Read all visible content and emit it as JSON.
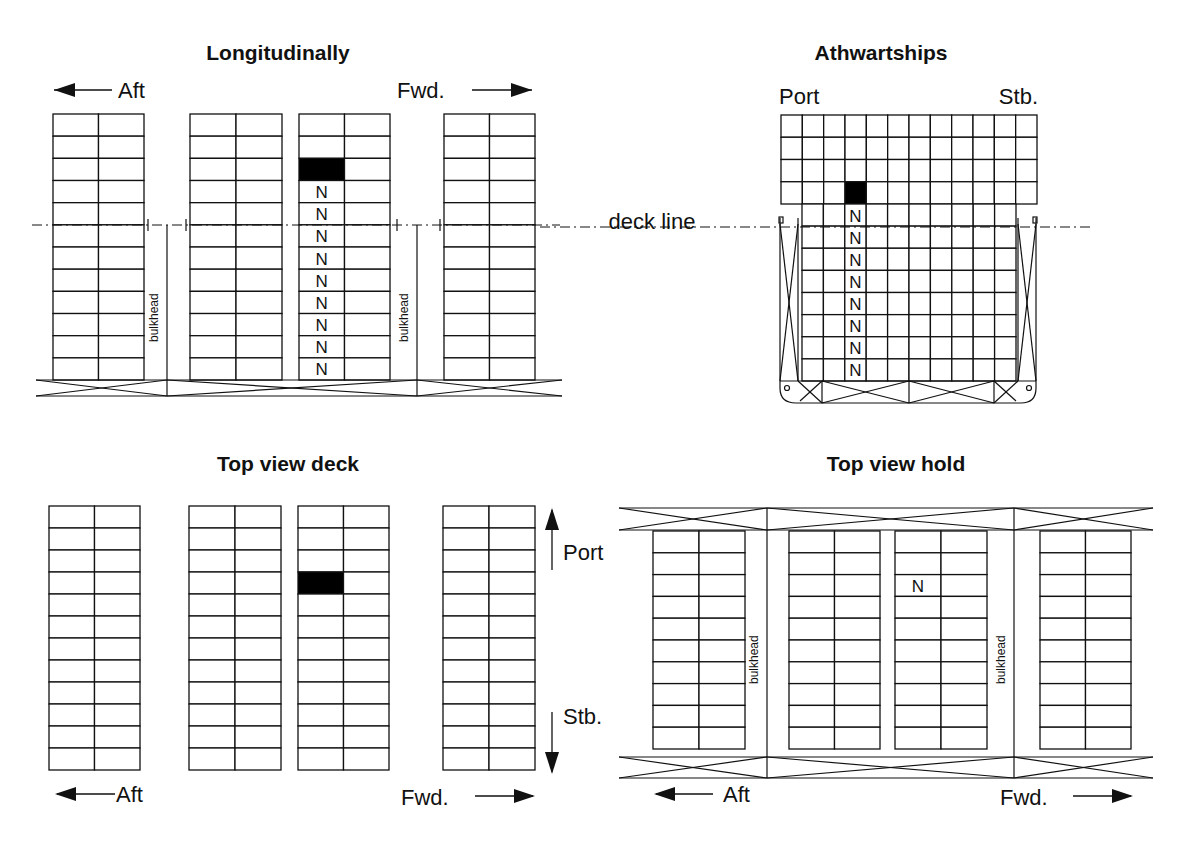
{
  "colors": {
    "ink": "#111111",
    "background": "#ffffff",
    "filled": "#000000"
  },
  "panels": {
    "longitudinal": {
      "title": "Longitudinally",
      "aft_label": "Aft",
      "fwd_label": "Fwd.",
      "bulkhead_label": "bulkhead",
      "rows": 12,
      "stacks": [
        {
          "x": 53,
          "w": 91
        },
        {
          "x": 190,
          "w": 92
        },
        {
          "x": 299,
          "w": 91
        },
        {
          "x": 444,
          "w": 91
        }
      ],
      "filled_cell": {
        "stack": 2,
        "col": 0,
        "row": 2
      },
      "n_marked": {
        "stack": 2,
        "col": 0,
        "rows": [
          3,
          4,
          5,
          6,
          7,
          8,
          9,
          10,
          11
        ]
      },
      "n_glyph": "N"
    },
    "athwartships": {
      "title": "Athwartships",
      "port_label": "Port",
      "stb_label": "Stb.",
      "deck_line_label": "deck line",
      "deck_tiers": 4,
      "deck_columns": 12,
      "hold_tiers": 8,
      "hold_columns": 10,
      "filled_cell": {
        "col": 3,
        "tier": 3
      },
      "n_column": 3,
      "n_glyph": "N"
    },
    "top_view_deck": {
      "title": "Top view deck",
      "aft_label": "Aft",
      "fwd_label": "Fwd.",
      "port_label": "Port",
      "stb_label": "Stb.",
      "rows": 12,
      "stacks": [
        {
          "x": 49,
          "w": 91
        },
        {
          "x": 189,
          "w": 92
        },
        {
          "x": 298,
          "w": 91
        },
        {
          "x": 443,
          "w": 92
        }
      ],
      "filled_cell": {
        "stack": 2,
        "col": 0,
        "row": 3
      }
    },
    "top_view_hold": {
      "title": "Top view hold",
      "aft_label": "Aft",
      "fwd_label": "Fwd.",
      "bulkhead_label": "bulkhead",
      "rows": 10,
      "stacks": [
        {
          "x": 653,
          "w": 92
        },
        {
          "x": 789,
          "w": 91
        },
        {
          "x": 895,
          "w": 92
        },
        {
          "x": 1040,
          "w": 91
        }
      ],
      "n_cell": {
        "stack": 2,
        "col": 0,
        "row": 2
      },
      "n_glyph": "N"
    }
  }
}
